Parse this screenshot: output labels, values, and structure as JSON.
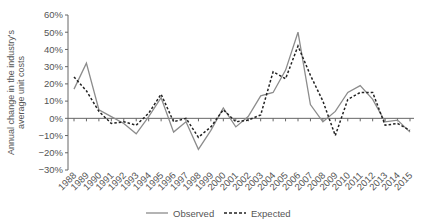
{
  "chart_data": {
    "type": "line",
    "title": "",
    "xlabel": "",
    "ylabel": "Annual change in the industry's average unit costs",
    "ylabel_lines": [
      "Annual change in the industry's",
      "average unit costs"
    ],
    "ylim": [
      -30,
      60
    ],
    "yticks": [
      60,
      50,
      40,
      30,
      20,
      10,
      0,
      -10,
      -20,
      -30
    ],
    "ytick_labels": [
      "60%",
      "50%",
      "40%",
      "30%",
      "20%",
      "10%",
      "0%",
      "−10%",
      "−20%",
      "−30%"
    ],
    "grid": false,
    "legend_position": "bottom",
    "x": [
      "1988",
      "1989",
      "1990",
      "1991",
      "1992",
      "1993",
      "1994",
      "1995",
      "1996",
      "1997",
      "1998",
      "1999",
      "2000",
      "2001",
      "2002",
      "2003",
      "2004",
      "2005",
      "2006",
      "2007",
      "2008",
      "2009",
      "2010",
      "2011",
      "2012",
      "2013",
      "2014",
      "2015"
    ],
    "series": [
      {
        "name": "Observed",
        "style": "solid",
        "color": "#8c8c8c",
        "values": [
          17,
          32,
          5,
          1,
          -3,
          -9,
          1,
          12,
          -8,
          -2,
          -18,
          -7,
          6,
          -5,
          1,
          13,
          15,
          28,
          50,
          8,
          -2,
          4,
          15,
          19,
          11,
          -2,
          -1,
          -8
        ]
      },
      {
        "name": "Expected",
        "style": "dashed",
        "color": "#222222",
        "values": [
          24,
          16,
          4,
          -3,
          -2,
          -4,
          3,
          14,
          -2,
          0,
          -11,
          -5,
          5,
          -2,
          -1,
          2,
          27,
          23,
          42,
          25,
          10,
          -10,
          11,
          15,
          15,
          -4,
          -3,
          -7
        ]
      }
    ]
  },
  "legend": {
    "observed_label": "Observed",
    "expected_label": "Expected"
  }
}
